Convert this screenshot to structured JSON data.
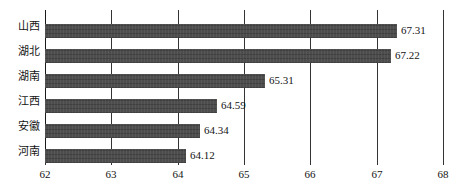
{
  "chart_data": {
    "type": "bar",
    "orientation": "horizontal",
    "title": "",
    "subtitle": "",
    "xlabel": "",
    "ylabel": "",
    "categories": [
      "山西",
      "湖北",
      "湖南",
      "江西",
      "安徽",
      "河南"
    ],
    "values": [
      67.31,
      67.22,
      65.31,
      64.59,
      64.34,
      64.12
    ],
    "value_labels": [
      "67.31",
      "67.22",
      "65.31",
      "64.59",
      "64.34",
      "64.12"
    ],
    "xlim": [
      62,
      68
    ],
    "xticks": [
      62,
      63,
      64,
      65,
      66,
      67,
      68
    ],
    "xtick_labels": [
      "62",
      "63",
      "64",
      "65",
      "66",
      "67",
      "68"
    ],
    "grid": true,
    "grid_axis": "x",
    "legend": false,
    "legend_position": "none",
    "bar_color": "#4d4d4d",
    "grid_color": "#333333",
    "text_color": "#141414",
    "background_color": "#ffffff",
    "series": [
      {
        "name": "",
        "values": [
          67.31,
          67.22,
          65.31,
          64.59,
          64.34,
          64.12
        ]
      }
    ]
  }
}
